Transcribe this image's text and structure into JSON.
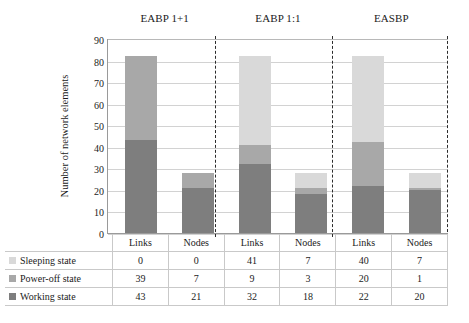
{
  "chart_data": {
    "type": "bar",
    "subtype": "stacked-bar-with-data-table",
    "title": "",
    "xlabel": "",
    "ylabel": "Number of network elements",
    "ylim": [
      0,
      90
    ],
    "ytick_step": 10,
    "yticks": [
      0,
      10,
      20,
      30,
      40,
      50,
      60,
      70,
      80,
      90
    ],
    "grid": true,
    "legend_position": "data-table-left",
    "group_labels": [
      "EABP 1+1",
      "EABP 1:1",
      "EASBP"
    ],
    "categories": [
      "Links",
      "Nodes",
      "Links",
      "Nodes",
      "Links",
      "Nodes"
    ],
    "series": [
      {
        "name": "Sleeping state",
        "color": "#d9d9d9",
        "values": [
          0,
          0,
          41,
          7,
          40,
          7
        ]
      },
      {
        "name": "Power-off state",
        "color": "#a8a8a8",
        "values": [
          39,
          7,
          9,
          3,
          20,
          1
        ]
      },
      {
        "name": "Working state",
        "color": "#7e7e7e",
        "values": [
          43,
          21,
          32,
          18,
          22,
          20
        ]
      }
    ],
    "stack_order_bottom_to_top": [
      "Working state",
      "Power-off state",
      "Sleeping state"
    ],
    "totals": [
      82,
      28,
      82,
      28,
      82,
      28
    ]
  },
  "table": {
    "header_row": [
      "",
      "Links",
      "Nodes",
      "Links",
      "Nodes",
      "Links",
      "Nodes"
    ],
    "rows": [
      {
        "label": "Sleeping state",
        "swatch": "sleeping-swatch",
        "values": [
          "0",
          "0",
          "41",
          "7",
          "40",
          "7"
        ]
      },
      {
        "label": "Power-off state",
        "swatch": "poweroff-swatch",
        "values": [
          "39",
          "7",
          "9",
          "3",
          "20",
          "1"
        ]
      },
      {
        "label": "Working state",
        "swatch": "working-swatch",
        "values": [
          "43",
          "21",
          "32",
          "18",
          "22",
          "20"
        ]
      }
    ]
  },
  "axis": {
    "y_title": "Number of network elements",
    "y_ticks": [
      "90",
      "80",
      "70",
      "60",
      "50",
      "40",
      "30",
      "20",
      "10",
      "0"
    ]
  },
  "groups": [
    {
      "label": "EABP 1+1"
    },
    {
      "label": "EABP 1:1"
    },
    {
      "label": "EASBP"
    }
  ],
  "colors": {
    "sleeping": "#d9d9d9",
    "poweroff": "#a8a8a8",
    "working": "#7e7e7e",
    "gridline": "#d2d2d2",
    "axis": "#9a9a9a",
    "separator": "#2b2b2b"
  }
}
